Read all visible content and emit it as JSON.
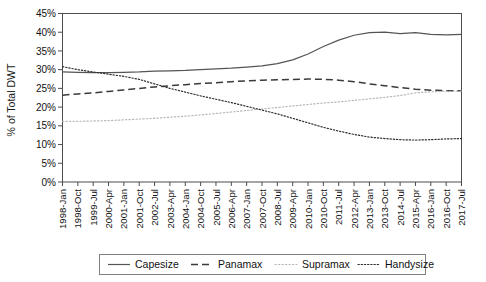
{
  "chart_data": {
    "type": "line",
    "title": "",
    "xlabel": "",
    "ylabel": "% of Total DWT",
    "ylim": [
      0,
      45
    ],
    "ytick_labels": [
      "0%",
      "5%",
      "10%",
      "15%",
      "20%",
      "25%",
      "30%",
      "35%",
      "40%",
      "45%"
    ],
    "ytick_values": [
      0,
      5,
      10,
      15,
      20,
      25,
      30,
      35,
      40,
      45
    ],
    "grid": false,
    "legend_position": "bottom",
    "categories": [
      "1998-Jan",
      "1998-Oct",
      "1999-Jul",
      "2000-Apr",
      "2001-Jan",
      "2001-Oct",
      "2002-Jul",
      "2003-Apr",
      "2004-Jan",
      "2004-Oct",
      "2005-Jul",
      "2006-Apr",
      "2007-Jan",
      "2007-Oct",
      "2008-Jul",
      "2009-Apr",
      "2010-Jan",
      "2010-Oct",
      "2011-Jul",
      "2012-Apr",
      "2013-Jan",
      "2013-Oct",
      "2014-Jul",
      "2015-Apr",
      "2016-Jan",
      "2016-Oct",
      "2017-Jul"
    ],
    "series": [
      {
        "name": "Capesize",
        "style": "solid",
        "color": "#555555",
        "values": [
          29.4,
          29.3,
          29.2,
          29.2,
          29.3,
          29.4,
          29.6,
          29.7,
          29.8,
          30.0,
          30.2,
          30.4,
          30.7,
          31.0,
          31.6,
          32.6,
          34.2,
          36.2,
          37.9,
          39.2,
          39.9,
          40.0,
          39.6,
          39.9,
          39.4,
          39.3,
          39.4
        ]
      },
      {
        "name": "Panamax",
        "style": "dashed",
        "color": "#3a3a3a",
        "values": [
          23.2,
          23.5,
          23.8,
          24.2,
          24.6,
          25.0,
          25.4,
          25.7,
          26.0,
          26.3,
          26.5,
          26.8,
          27.0,
          27.2,
          27.3,
          27.4,
          27.5,
          27.4,
          27.2,
          26.8,
          26.2,
          25.7,
          25.2,
          24.8,
          24.5,
          24.4,
          24.4
        ]
      },
      {
        "name": "Supramax",
        "style": "dotted-light",
        "color": "#b8b8b8",
        "values": [
          16.2,
          16.2,
          16.3,
          16.4,
          16.6,
          16.8,
          17.0,
          17.3,
          17.6,
          17.9,
          18.3,
          18.7,
          19.1,
          19.5,
          19.9,
          20.3,
          20.7,
          21.1,
          21.4,
          21.8,
          22.2,
          22.6,
          23.1,
          23.8,
          24.1,
          24.2,
          24.3
        ]
      },
      {
        "name": "Handysize",
        "style": "dotted",
        "color": "#2b2b2b",
        "values": [
          30.8,
          30.0,
          29.4,
          28.8,
          28.2,
          27.4,
          26.2,
          25.0,
          24.0,
          23.0,
          22.1,
          21.2,
          20.2,
          19.2,
          18.2,
          17.0,
          15.8,
          14.6,
          13.6,
          12.7,
          12.0,
          11.6,
          11.3,
          11.2,
          11.3,
          11.5,
          11.6
        ]
      }
    ]
  },
  "legend": {
    "items": [
      {
        "label": "Capesize"
      },
      {
        "label": "Panamax"
      },
      {
        "label": "Supramax"
      },
      {
        "label": "Handysize"
      }
    ]
  }
}
